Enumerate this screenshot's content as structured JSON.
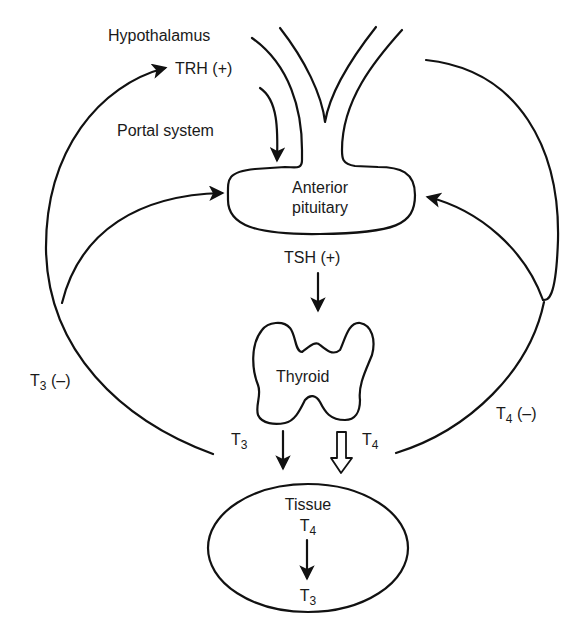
{
  "diagram": {
    "colors": {
      "line": "#111111",
      "text": "#1a1a1a",
      "background": "#ffffff"
    },
    "labels": {
      "hypothalamus": "Hypothalamus",
      "trh": "TRH (+)",
      "portal_system": "Portal system",
      "anterior_pituitary_line1": "Anterior",
      "anterior_pituitary_line2": "pituitary",
      "tsh": "TSH (+)",
      "thyroid": "Thyroid",
      "t3_feedback_main": "T",
      "t3_feedback_sub": "3",
      "t3_feedback_sign": " (–)",
      "t4_feedback_main": "T",
      "t4_feedback_sub": "4",
      "t4_feedback_sign": " (–)",
      "t3_output_main": "T",
      "t3_output_sub": "3",
      "t4_output_main": "T",
      "t4_output_sub": "4",
      "tissue": "Tissue",
      "tissue_t4_main": "T",
      "tissue_t4_sub": "4",
      "tissue_t3_main": "T",
      "tissue_t3_sub": "3"
    },
    "nodes": [
      "Hypothalamus",
      "Anterior pituitary",
      "Thyroid",
      "Tissue"
    ],
    "edges": [
      {
        "from": "Hypothalamus",
        "to": "Anterior pituitary",
        "label": "TRH (+) via Portal system"
      },
      {
        "from": "Anterior pituitary",
        "to": "Thyroid",
        "label": "TSH (+)"
      },
      {
        "from": "Thyroid",
        "to": "Tissue",
        "label": "T3",
        "style": "solid arrow"
      },
      {
        "from": "Thyroid",
        "to": "Tissue",
        "label": "T4",
        "style": "hollow arrow"
      },
      {
        "from": "Tissue T4",
        "to": "Tissue T3",
        "label": ""
      },
      {
        "from": "T3",
        "to": "Hypothalamus",
        "label": "T3 (–)"
      },
      {
        "from": "T3",
        "to": "Anterior pituitary",
        "label": "T3 (–)"
      },
      {
        "from": "T4",
        "to": "Hypothalamus",
        "label": "T4 (–)"
      },
      {
        "from": "T4",
        "to": "Anterior pituitary",
        "label": "T4 (–)"
      }
    ]
  }
}
